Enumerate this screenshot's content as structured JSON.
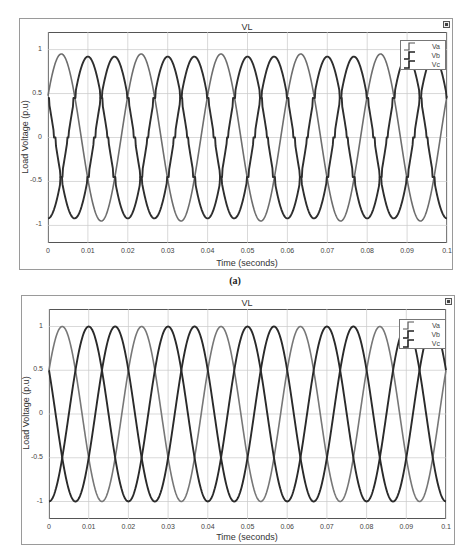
{
  "chart_data": [
    {
      "id": "a",
      "type": "line",
      "title": "VL",
      "xlabel": "Time (seconds)",
      "ylabel": "Load Voltage (p.u)",
      "xlim": [
        0,
        0.1
      ],
      "ylim": [
        -1.2,
        1.2
      ],
      "xticks": [
        0,
        0.01,
        0.02,
        0.03,
        0.04,
        0.05,
        0.06,
        0.07,
        0.08,
        0.09,
        0.1
      ],
      "xtick_labels": [
        "0",
        "0.01",
        "0.02",
        "0.03",
        "0.04",
        "0.05",
        "0.06",
        "0.07",
        "0.08",
        "0.09",
        "0.1"
      ],
      "yticks": [
        1,
        0.5,
        0,
        -0.5,
        -1
      ],
      "ytick_labels": [
        "1",
        "0.5",
        "0",
        "-0.5",
        "-1"
      ],
      "grid": true,
      "legend_position": "top-right",
      "caption": "(a)",
      "waveform": "distorted three-phase (stepped plateaus near ±0.45 and 0)",
      "frequency_hz": 50,
      "series": [
        {
          "name": "Va",
          "color": "#6e6e6e",
          "amplitude": 0.95,
          "phase_deg": 30,
          "distorted": false
        },
        {
          "name": "Vb",
          "color": "#2e2e2e",
          "amplitude": 0.92,
          "phase_deg": -90,
          "distorted": true
        },
        {
          "name": "Vc",
          "color": "#2e2e2e",
          "amplitude": 0.92,
          "phase_deg": 150,
          "distorted": true
        }
      ],
      "sample_points": {
        "t": [
          0,
          0.0033,
          0.01,
          0.0167,
          0.02
        ],
        "Va": [
          0.5,
          0.95,
          -0.5,
          -0.95,
          0.5
        ],
        "Vb": [
          -0.75,
          -0.45,
          0.9,
          0.45,
          -0.75
        ],
        "Vc": [
          0.45,
          0.45,
          -0.45,
          0.93,
          0.45
        ]
      }
    },
    {
      "id": "b",
      "type": "line",
      "title": "VL",
      "xlabel": "Time (seconds)",
      "ylabel": "Load Voltage (p.u)",
      "xlim": [
        0,
        0.1
      ],
      "ylim": [
        -1.2,
        1.2
      ],
      "xticks": [
        0,
        0.01,
        0.02,
        0.03,
        0.04,
        0.05,
        0.06,
        0.07,
        0.08,
        0.09,
        0.1
      ],
      "xtick_labels": [
        "0",
        "0.01",
        "0.02",
        "0.03",
        "0.04",
        "0.05",
        "0.06",
        "0.07",
        "0.08",
        "0.09",
        "0.1"
      ],
      "yticks": [
        1,
        0.5,
        0,
        -0.5,
        -1
      ],
      "ytick_labels": [
        "1",
        "0.5",
        "0",
        "-0.5",
        "-1"
      ],
      "grid": true,
      "legend_position": "top-right",
      "waveform": "pure sinusoidal three-phase",
      "frequency_hz": 50,
      "series": [
        {
          "name": "Va",
          "color": "#777777",
          "amplitude": 1.0,
          "phase_deg": 30,
          "distorted": false
        },
        {
          "name": "Vb",
          "color": "#2a2a2a",
          "amplitude": 1.0,
          "phase_deg": -90,
          "distorted": false
        },
        {
          "name": "Vc",
          "color": "#2a2a2a",
          "amplitude": 1.0,
          "phase_deg": 150,
          "distorted": false
        }
      ],
      "sample_points": {
        "t": [
          0,
          0.0033,
          0.01,
          0.0167,
          0.02
        ],
        "Va": [
          0.5,
          1.0,
          -0.5,
          -1.0,
          0.5
        ],
        "Vb": [
          -1.0,
          -0.5,
          1.0,
          0.5,
          -1.0
        ],
        "Vc": [
          0.5,
          -0.5,
          -0.5,
          1.0,
          0.5
        ]
      }
    }
  ],
  "charts": [
    {
      "title": "VL",
      "xlabel": "Time (seconds)",
      "ylabel": "Load Voltage (p.u)",
      "legend": [
        "Va",
        "Vb",
        "Vc"
      ],
      "caption": "(a)"
    },
    {
      "title": "VL",
      "xlabel": "Time (seconds)",
      "ylabel": "Load Voltage (p.u)",
      "legend": [
        "Va",
        "Vb",
        "Vc"
      ]
    }
  ],
  "icons": {
    "expand": "expand-icon",
    "legend_line": "step-line-icon"
  }
}
